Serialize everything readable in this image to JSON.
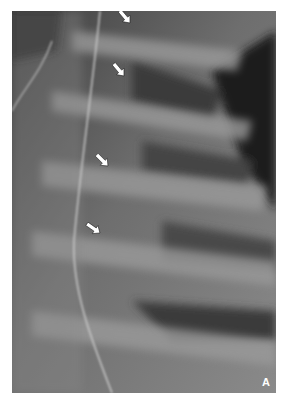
{
  "figure": {
    "panel_label": "A",
    "arrows": [
      {
        "x": 118,
        "y": 12
      },
      {
        "x": 112,
        "y": 65
      },
      {
        "x": 96,
        "y": 155
      },
      {
        "x": 88,
        "y": 222
      }
    ],
    "colors": {
      "background": "#ffffff",
      "arrow": "#ffffff"
    }
  }
}
